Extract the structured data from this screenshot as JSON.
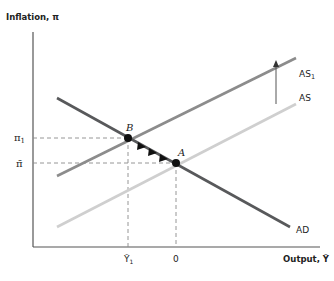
{
  "axes": {
    "y_label": "Inflation, π",
    "x_label": "Output, Ỹ"
  },
  "y_ticks": [
    {
      "id": "pi1",
      "label": "π",
      "sub": "1"
    },
    {
      "id": "pibar",
      "label": "π̄"
    }
  ],
  "x_ticks": [
    {
      "id": "y1",
      "label": "Ỹ",
      "sub": "1"
    },
    {
      "id": "zero",
      "label": "0"
    }
  ],
  "curves": [
    {
      "id": "AD",
      "label": "AD",
      "color": "#58595b"
    },
    {
      "id": "AS1",
      "label": "AS",
      "sub": "1",
      "color": "#8c8c8c"
    },
    {
      "id": "AS",
      "label": "AS",
      "color": "#cfcfcf"
    }
  ],
  "points": [
    {
      "id": "B",
      "label": "B"
    },
    {
      "id": "A",
      "label": "A"
    }
  ],
  "colors": {
    "axis": "#555555",
    "dash": "#8a8a8a",
    "point": "#111111",
    "arrow": "#555555"
  }
}
